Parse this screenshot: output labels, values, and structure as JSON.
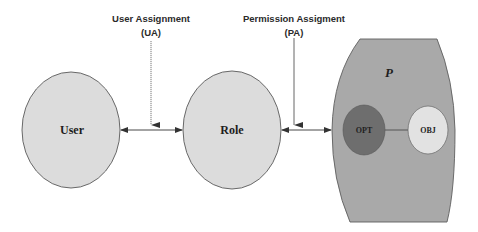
{
  "diagram": {
    "type": "RBAC model",
    "nodes": {
      "user": {
        "label": "User",
        "fill": "#dcdcdc"
      },
      "role": {
        "label": "Role",
        "fill": "#dcdcdc"
      },
      "permission": {
        "label": "P",
        "fill": "#a9a9a9"
      },
      "operation": {
        "label": "OPT",
        "fill": "#6e6e6e"
      },
      "object": {
        "label": "OBJ",
        "fill": "#e2e2e2"
      }
    },
    "relations": {
      "user_assignment": {
        "line1": "User Assignment",
        "line2": "(UA)"
      },
      "permission_assignment": {
        "line1": "Permission Assigment",
        "line2": "(PA)"
      }
    },
    "edges": [
      {
        "from": "User",
        "to": "Role",
        "style": "bidirectional-arrow",
        "annotated_by": "UA"
      },
      {
        "from": "Role",
        "to": "P",
        "style": "bidirectional-arrow",
        "annotated_by": "PA"
      },
      {
        "from": "OPT",
        "to": "OBJ",
        "style": "line"
      }
    ],
    "colors": {
      "stroke": "#555555",
      "arrow": "#333333"
    }
  }
}
